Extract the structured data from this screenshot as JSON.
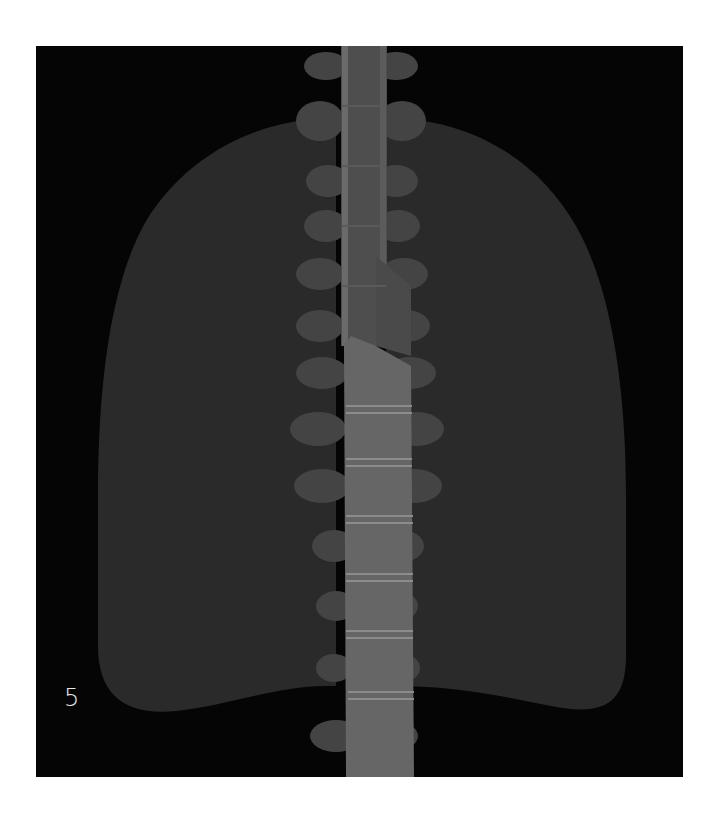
{
  "figure": {
    "panel_label": "5",
    "colors": {
      "background": "#050505",
      "lung": "#2a2a2a",
      "vertebra": "#5a5a5a",
      "vertebra_body_lower": "#6a6a6a",
      "transverse_process": "#454545",
      "disc_line": "#8a8a8a",
      "trachea": "#4a4a4a",
      "panel_label": "#e6e6e6"
    }
  }
}
